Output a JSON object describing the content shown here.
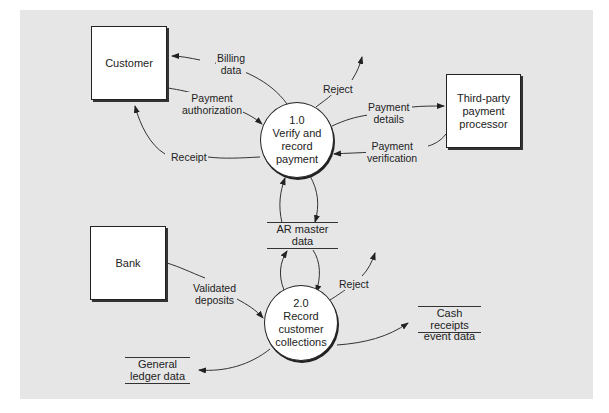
{
  "diagram": {
    "type": "data-flow-diagram",
    "colors": {
      "background": "#e6e6e6",
      "box_fill": "#ffffff",
      "line": "#333333"
    },
    "entities": [
      {
        "id": "customer",
        "label": "Customer"
      },
      {
        "id": "processor",
        "label": "Third-party payment processor"
      },
      {
        "id": "bank",
        "label": "Bank"
      }
    ],
    "processes": [
      {
        "id": "p1",
        "number": "1.0",
        "line1": "Verify and",
        "line2": "record",
        "line3": "payment"
      },
      {
        "id": "p2",
        "number": "2.0",
        "line1": "Record",
        "line2": "customer",
        "line3": "collections"
      }
    ],
    "stores": [
      {
        "id": "ar",
        "line1": "AR master",
        "line2": "data"
      },
      {
        "id": "cash",
        "line1": "Cash receipts",
        "line2": "event data"
      },
      {
        "id": "gl",
        "line1": "General",
        "line2": "ledger data"
      }
    ],
    "flows": {
      "billing": {
        "line1": "Billing",
        "line2": "data"
      },
      "payauth": {
        "line1": "Payment",
        "line2": "authorization"
      },
      "receipt": {
        "line1": "Receipt"
      },
      "reject1": {
        "line1": "Reject"
      },
      "paydetails": {
        "line1": "Payment",
        "line2": "details"
      },
      "payverif": {
        "line1": "Payment",
        "line2": "verification"
      },
      "deposits": {
        "line1": "Validated",
        "line2": "deposits"
      },
      "reject2": {
        "line1": "Reject"
      }
    }
  }
}
